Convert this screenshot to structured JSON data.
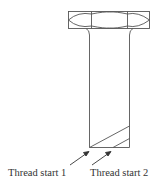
{
  "diagram": {
    "labels": [
      {
        "id": "thread-start-1",
        "text": "Thread start 1"
      },
      {
        "id": "thread-start-2",
        "text": "Thread start 2"
      }
    ],
    "colors": {
      "stroke": "#555555",
      "text": "#333333"
    }
  }
}
